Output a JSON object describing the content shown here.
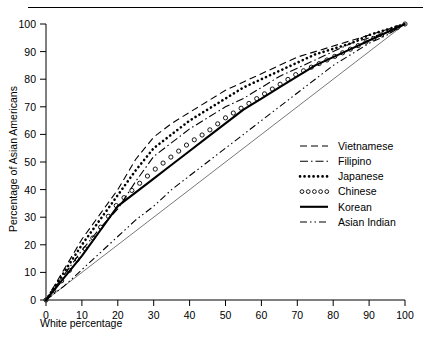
{
  "figure": {
    "top_rule": true,
    "background": "#ffffff",
    "ink": "#000000"
  },
  "chart_data": {
    "type": "line",
    "title": "",
    "subtitle": "",
    "xlabel": "White percentage",
    "ylabel": "Percentage of Asian Americans",
    "xlim": [
      0,
      100
    ],
    "ylim": [
      0,
      100
    ],
    "xticks": [
      0,
      10,
      20,
      30,
      40,
      50,
      60,
      70,
      80,
      90,
      100
    ],
    "yticks": [
      0,
      10,
      20,
      30,
      40,
      50,
      60,
      70,
      80,
      90,
      100
    ],
    "xtick_labels": [
      "0",
      "10",
      "20",
      "30",
      "40",
      "50",
      "60",
      "70",
      "80",
      "90",
      "100"
    ],
    "ytick_labels": [
      "0",
      "10",
      "20",
      "30",
      "40",
      "50",
      "60",
      "70",
      "80",
      "90",
      "100"
    ],
    "grid": false,
    "legend_position": "center-right",
    "reference_line": {
      "name": "equality-diagonal",
      "x": [
        0,
        100
      ],
      "y": [
        0,
        100
      ],
      "style": "thin-solid"
    },
    "x": [
      0,
      5,
      10,
      15,
      20,
      25,
      30,
      35,
      40,
      45,
      50,
      55,
      60,
      65,
      70,
      75,
      80,
      85,
      90,
      95,
      100
    ],
    "series": [
      {
        "name": "Vietnamese",
        "style": "dashed",
        "values": [
          0,
          11,
          22,
          31,
          40,
          51,
          59,
          64,
          68,
          72,
          76,
          79,
          82,
          85,
          88,
          90,
          92,
          94,
          96,
          98,
          100
        ]
      },
      {
        "name": "Filipino",
        "style": "dash-dot",
        "values": [
          0,
          9,
          18,
          26,
          33,
          43,
          52,
          57,
          62,
          66,
          70,
          73,
          77,
          81,
          84,
          87,
          90,
          93,
          95,
          97,
          100
        ]
      },
      {
        "name": "Japanese",
        "style": "dotted-bold",
        "values": [
          0,
          10,
          20,
          29,
          38,
          47,
          55,
          60,
          65,
          69,
          73,
          77,
          80,
          83,
          86,
          89,
          91,
          93,
          96,
          98,
          100
        ]
      },
      {
        "name": "Chinese",
        "style": "open-circles",
        "values": [
          0,
          8,
          17,
          26,
          35,
          41,
          47,
          52,
          57,
          61,
          66,
          70,
          74,
          78,
          82,
          85,
          88,
          91,
          94,
          97,
          100
        ]
      },
      {
        "name": "Korean",
        "style": "solid-bold",
        "values": [
          0,
          8,
          16,
          25,
          34,
          39,
          44,
          49,
          54,
          59,
          64,
          69,
          73,
          77,
          81,
          85,
          88,
          91,
          94,
          97,
          100
        ]
      },
      {
        "name": "Asian Indian",
        "style": "dash-dot-dot",
        "values": [
          0,
          5,
          11,
          17,
          23,
          29,
          34,
          40,
          45,
          50,
          55,
          60,
          65,
          70,
          75,
          80,
          85,
          89,
          93,
          96,
          100
        ]
      }
    ]
  },
  "legend": {
    "entries": [
      {
        "label": "Vietnamese",
        "style": "dashed"
      },
      {
        "label": "Filipino",
        "style": "dash-dot"
      },
      {
        "label": "Japanese",
        "style": "dotted-bold"
      },
      {
        "label": "Chinese",
        "style": "open-circles"
      },
      {
        "label": "Korean",
        "style": "solid-bold"
      },
      {
        "label": "Asian Indian",
        "style": "dash-dot-dot"
      }
    ]
  }
}
